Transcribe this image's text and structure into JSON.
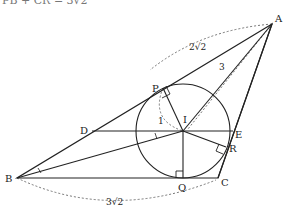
{
  "header_text": "PB + CR = 3√2",
  "points": {
    "A": {
      "label": "A",
      "x": 272,
      "y": 24
    },
    "B": {
      "label": "B",
      "x": 17,
      "y": 178
    },
    "C": {
      "label": "C",
      "x": 218,
      "y": 178
    },
    "D": {
      "label": "D",
      "x": 92,
      "y": 131
    },
    "E": {
      "label": "E",
      "x": 233,
      "y": 131
    },
    "I": {
      "label": "I",
      "x": 183,
      "y": 131
    },
    "P": {
      "label": "P",
      "x": 163,
      "y": 88
    },
    "Q": {
      "label": "Q",
      "x": 183,
      "y": 178
    },
    "R": {
      "label": "R",
      "x": 226,
      "y": 147
    }
  },
  "incircle": {
    "cx": 183,
    "cy": 131,
    "r": 47
  },
  "measurements": {
    "AP": "2√2",
    "AI": "3",
    "PI": "1",
    "BC": "3√2"
  },
  "colors": {
    "line": "#222222",
    "dashed": "#666666"
  }
}
